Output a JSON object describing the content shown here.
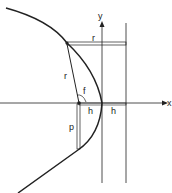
{
  "diagram": {
    "axes": {
      "x_label": "x",
      "y_label": "y"
    },
    "labels": {
      "r_top": "r",
      "r_radius": "r",
      "f": "f",
      "p": "p",
      "h_left": "h",
      "h_right": "h"
    },
    "colors": {
      "stroke": "#222222",
      "background": "#ffffff"
    }
  }
}
